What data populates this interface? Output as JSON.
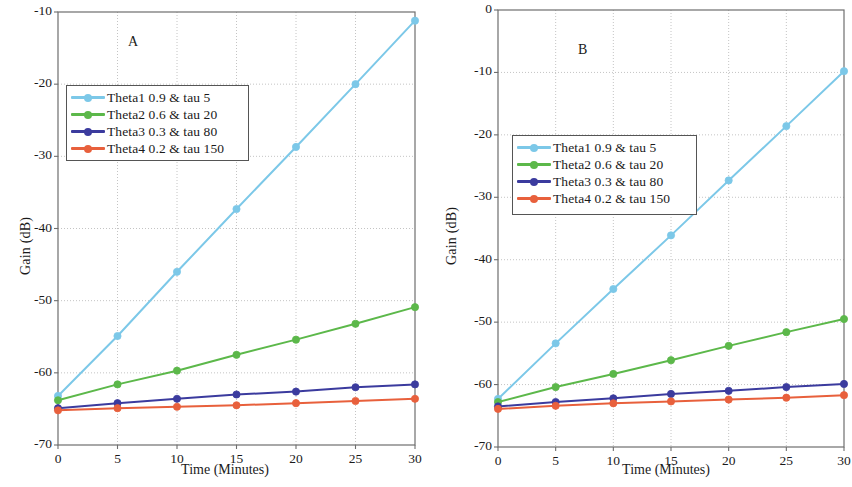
{
  "figure": {
    "panels": [
      {
        "id": "A",
        "letter": "A",
        "xlabel": "Time (Minutes)",
        "ylabel": "Gain (dB)",
        "xticks": [
          "0",
          "5",
          "10",
          "15",
          "20",
          "25",
          "30"
        ],
        "yticks": [
          "-10",
          "-20",
          "-30",
          "-40",
          "-50",
          "-60",
          "-70"
        ]
      },
      {
        "id": "B",
        "letter": "B",
        "xlabel": "Time (Minutes)",
        "ylabel": "Gain (dB)",
        "xticks": [
          "0",
          "5",
          "10",
          "15",
          "20",
          "25",
          "30"
        ],
        "yticks": [
          "0",
          "-10",
          "-20",
          "-30",
          "-40",
          "-50",
          "-60",
          "-70"
        ]
      }
    ],
    "legend": {
      "entries": [
        "Theta1  0.9 & tau 5",
        "Theta2 0.6 & tau 20",
        "Theta3 0.3 & tau 80",
        "Theta4 0.2 & tau 150"
      ]
    }
  },
  "colors": {
    "theta1": "#7cc8e8",
    "theta2": "#5cb84a",
    "theta3": "#3b3b9e",
    "theta4": "#e8603c",
    "axis": "#6e6e6e",
    "grid": "#bdbdbd",
    "text": "#1a1a1a"
  },
  "chart_data": [
    {
      "type": "line",
      "panel": "A",
      "title": "A",
      "xlabel": "Time (Minutes)",
      "ylabel": "Gain (dB)",
      "x": [
        0,
        5,
        10,
        15,
        20,
        25,
        30
      ],
      "xlim": [
        0,
        30
      ],
      "ylim": [
        -70,
        -10
      ],
      "xticks": [
        0,
        5,
        10,
        15,
        20,
        25,
        30
      ],
      "yticks": [
        -70,
        -60,
        -50,
        -40,
        -30,
        -20,
        -10
      ],
      "grid": true,
      "legend_position": "upper left",
      "series": [
        {
          "name": "Theta1  0.9 & tau 5",
          "values": [
            -63.2,
            -54.9,
            -46.0,
            -37.3,
            -28.7,
            -20.0,
            -11.2
          ]
        },
        {
          "name": "Theta2 0.6 & tau 20",
          "values": [
            -63.8,
            -61.6,
            -59.7,
            -57.5,
            -55.4,
            -53.2,
            -50.9
          ]
        },
        {
          "name": "Theta3 0.3 & tau 80",
          "values": [
            -64.9,
            -64.2,
            -63.6,
            -63.0,
            -62.6,
            -62.0,
            -61.6
          ]
        },
        {
          "name": "Theta4 0.2 & tau 150",
          "values": [
            -65.2,
            -64.9,
            -64.7,
            -64.5,
            -64.2,
            -63.9,
            -63.6
          ]
        }
      ]
    },
    {
      "type": "line",
      "panel": "B",
      "title": "B",
      "xlabel": "Time (Minutes)",
      "ylabel": "Gain (dB)",
      "x": [
        0,
        5,
        10,
        15,
        20,
        25,
        30
      ],
      "xlim": [
        0,
        30
      ],
      "ylim": [
        -70,
        0
      ],
      "xticks": [
        0,
        5,
        10,
        15,
        20,
        25,
        30
      ],
      "yticks": [
        -70,
        -60,
        -50,
        -40,
        -30,
        -20,
        -10,
        0
      ],
      "grid": true,
      "legend_position": "upper left",
      "series": [
        {
          "name": "Theta1  0.9 & tau 5",
          "values": [
            -62.3,
            -53.4,
            -44.7,
            -36.1,
            -27.3,
            -18.6,
            -9.8
          ]
        },
        {
          "name": "Theta2 0.6 & tau 20",
          "values": [
            -62.8,
            -60.4,
            -58.3,
            -56.1,
            -53.8,
            -51.6,
            -49.5
          ]
        },
        {
          "name": "Theta3 0.3 & tau 80",
          "values": [
            -63.5,
            -62.8,
            -62.2,
            -61.5,
            -61.0,
            -60.4,
            -59.9
          ]
        },
        {
          "name": "Theta4 0.2 & tau 150",
          "values": [
            -63.9,
            -63.4,
            -63.0,
            -62.7,
            -62.4,
            -62.1,
            -61.7
          ]
        }
      ]
    }
  ]
}
